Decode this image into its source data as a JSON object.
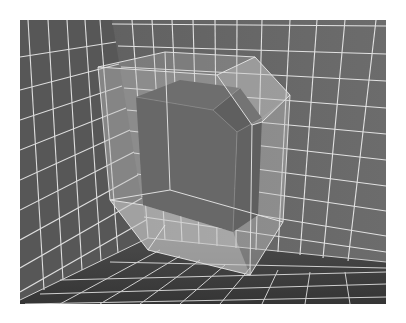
{
  "scene": {
    "description": "Grayscale 3D render: dark cube with a beveled corner enclosed in a translucent beveled box, placed in the corner of a room with white grid lines on walls and floor",
    "colors": {
      "background": "#ffffff",
      "wall_left": "#5a5a5a",
      "wall_back": "#666666",
      "floor": "#3e3e3e",
      "grid_line": "#e6e6e6",
      "inner_cube_front": "#4c4c4c",
      "inner_cube_top": "#555555",
      "inner_cube_side": "#474747",
      "inner_cube_bevel": "#3f3f3f",
      "outer_box_fill": "#bdbdbd",
      "outer_box_edge": "#dcdcdc"
    },
    "objects": [
      {
        "name": "inner-cube",
        "type": "beveled cube",
        "beveled_corner": "top-right"
      },
      {
        "name": "outer-box",
        "type": "translucent beveled box",
        "beveled_edges": [
          "top-right",
          "bottom-left"
        ]
      }
    ],
    "environment": {
      "walls": [
        "left",
        "back"
      ],
      "floor": true,
      "grid": true
    }
  }
}
